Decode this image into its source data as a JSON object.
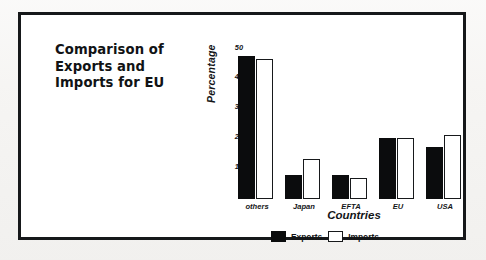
{
  "figure": {
    "title_lines": [
      "Comparison of",
      "Exports and",
      "Imports for EU"
    ]
  },
  "chart_data": {
    "type": "bar",
    "title": "Comparison of Exports and Imports for EU",
    "categories": [
      "others",
      "Japan",
      "EFTA",
      "EU",
      "USA"
    ],
    "series": [
      {
        "name": "Exports",
        "values": [
          47,
          8,
          8,
          20,
          17
        ],
        "color": "#0b0c0d"
      },
      {
        "name": "Imports",
        "values": [
          46,
          13,
          7,
          20,
          21
        ],
        "color": "#ffffff"
      }
    ],
    "xlabel": "Countries",
    "ylabel": "Percentage",
    "ylim": [
      0,
      50
    ],
    "yticks": [
      0,
      10,
      20,
      30,
      40,
      50
    ],
    "ytick_labels": [
      "0",
      "10",
      "20",
      "30",
      "40",
      "50"
    ],
    "grid": false,
    "legend_position": "bottom"
  },
  "legend": {
    "items": [
      {
        "label": "Exports",
        "swatch": "filled-black-swatch"
      },
      {
        "label": "Imports",
        "swatch": "outlined-white-swatch"
      }
    ]
  }
}
